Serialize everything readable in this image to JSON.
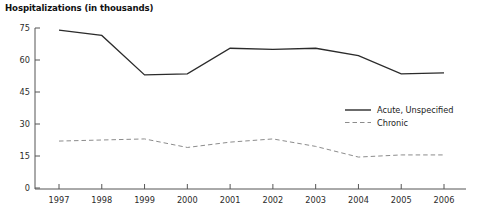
{
  "chart_data": {
    "type": "line",
    "title": "Hospitalizations (in thousands)",
    "xlabel": "",
    "ylabel": "",
    "grid": false,
    "legend_position": "center-right",
    "x": [
      "1997",
      "1998",
      "1999",
      "2000",
      "2001",
      "2002",
      "2003",
      "2004",
      "2005",
      "2006"
    ],
    "categories": [
      "1997",
      "1998",
      "1999",
      "2000",
      "2001",
      "2002",
      "2003",
      "2004",
      "2005",
      "2006"
    ],
    "xlim": [
      "1997",
      "2006"
    ],
    "ylim": [
      0,
      75
    ],
    "ytick_labels": [
      "0",
      "15",
      "30",
      "45",
      "60",
      "75"
    ],
    "ytick_values": [
      0,
      15,
      30,
      45,
      60,
      75
    ],
    "xtick_labels": [
      "1997",
      "1998",
      "1999",
      "2000",
      "2001",
      "2002",
      "2003",
      "2004",
      "2005",
      "2006"
    ],
    "series": [
      {
        "name": "Acute, Unspecified",
        "style": "solid",
        "color": "#2b2b2b",
        "values": [
          74,
          71.5,
          53,
          53.5,
          65.5,
          65,
          65.5,
          62,
          53.5,
          54
        ]
      },
      {
        "name": "Chronic",
        "style": "dashed",
        "color": "#8c8c8c",
        "values": [
          22,
          22.5,
          23,
          19,
          21.5,
          23,
          19.5,
          14.5,
          15.5,
          15.5
        ]
      }
    ],
    "legend": [
      {
        "label": "Acute, Unspecified",
        "style": "solid",
        "color": "#2b2b2b"
      },
      {
        "label": "Chronic",
        "style": "dashed",
        "color": "#8c8c8c"
      }
    ]
  },
  "axis": {
    "line_color": "#555555"
  }
}
